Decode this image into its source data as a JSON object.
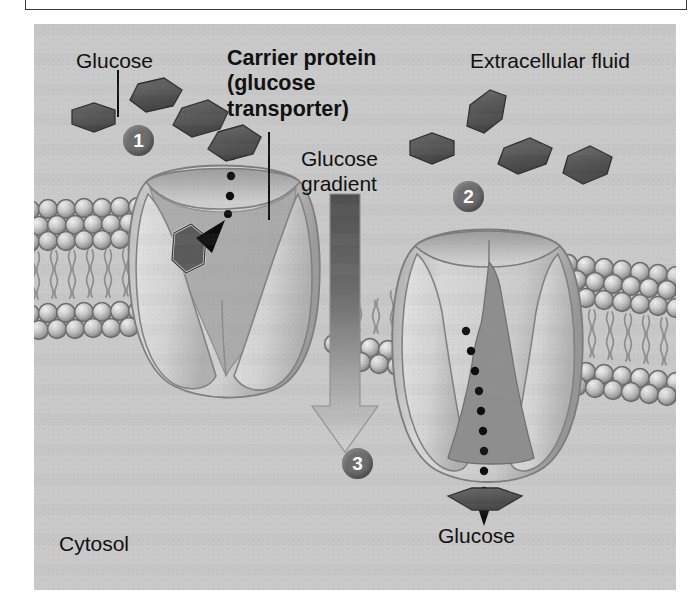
{
  "figure": {
    "type": "biology-diagram",
    "panel_bg_color": "#c9c9c9",
    "labels": {
      "glucose_extracellular": "Glucose",
      "carrier_protein": "Carrier protein\n(glucose\ntransporter)",
      "extracellular_fluid": "Extracellular fluid",
      "glucose_gradient": "Glucose\ngradient",
      "glucose_cytosolic": "Glucose",
      "cytosol": "Cytosol"
    },
    "steps": [
      {
        "number": "1",
        "region": "extracellular"
      },
      {
        "number": "2",
        "region": "extracellular"
      },
      {
        "number": "3",
        "region": "cytosol"
      }
    ],
    "colors": {
      "glucose_fill": "#5a5a5a",
      "glucose_stroke": "#2e2e2e",
      "membrane_head": "#b5b5b5",
      "membrane_head_stroke": "#6f6f6f",
      "membrane_tail": "#9a9a9a",
      "protein_light": "#d4d4d4",
      "protein_mid": "#b0b0b0",
      "protein_dark": "#8f8f8f",
      "gradient_arrow_top": "#4a4a4a",
      "gradient_arrow_bottom": "#d0d0d0",
      "step_circle": "#6d6d6d",
      "text": "#111111"
    },
    "elements": {
      "membrane": "phospholipid bilayer with spherical head groups and wavy tails",
      "left_transporter_state": "open to extracellular fluid, glucose bound in cavity",
      "right_transporter_state": "open to cytosol, glucose released",
      "gradient_arrow_direction": "downward, extracellular to cytosol"
    }
  }
}
